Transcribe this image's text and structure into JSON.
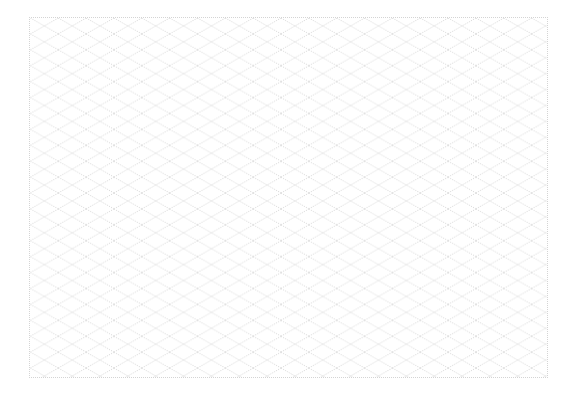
{
  "sheet": {
    "pattern": "isometric-diamond-grid",
    "line_color": "#cfcfcf",
    "border_color": "#d4d4d4",
    "background_color": "#ffffff",
    "cell_width_px": 28,
    "cell_height_px": 16,
    "line_style": "dotted"
  }
}
